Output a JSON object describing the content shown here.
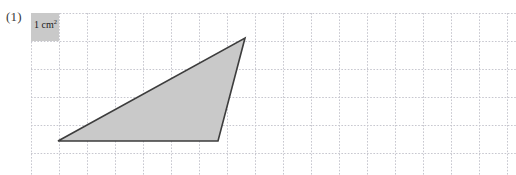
{
  "figure": {
    "item_number": "(1)",
    "width": 516,
    "height": 175,
    "background_color": "#ffffff"
  },
  "legend": {
    "unit_label_text": "1 cm",
    "unit_label_exponent": "2",
    "unit_label_full": "1 cm²",
    "swatch_fill_color": "#c9c9c9",
    "swatch_origin": [
      31,
      13
    ],
    "swatch_size": [
      28,
      28
    ]
  },
  "grid": {
    "origin": [
      31,
      13
    ],
    "cell_size": 28,
    "columns": 17,
    "rows": 5,
    "line_color": "#c7c7cf",
    "line_style": "dotted",
    "line_width": 1,
    "x_lines": [
      31,
      59,
      87,
      115,
      143,
      171,
      199,
      227,
      255,
      283,
      311,
      339,
      367,
      395,
      423,
      451,
      479,
      507
    ],
    "y_lines": [
      13,
      41,
      69,
      97,
      125,
      153
    ]
  },
  "shape": {
    "name": "triangle",
    "fill_color": "#c9c9c9",
    "stroke_color": "#3d3d3d",
    "stroke_width": 1.6,
    "vertices": [
      {
        "label": "left",
        "x": 58,
        "y": 141
      },
      {
        "label": "bottom-right",
        "x": 218,
        "y": 141
      },
      {
        "label": "apex",
        "x": 245,
        "y": 38
      }
    ],
    "points_attr": "58,141 218,141 245,38",
    "base_cells": 5.7,
    "height_cells": 3.7
  }
}
